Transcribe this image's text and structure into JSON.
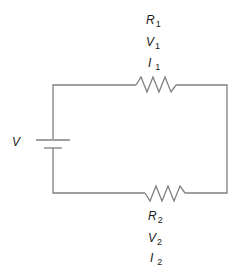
{
  "diagram": {
    "type": "series-circuit",
    "source": {
      "label": "V"
    },
    "components": [
      {
        "id": "R1",
        "symbol": "R",
        "sub": "1",
        "labels": [
          {
            "symbol": "R",
            "sub": "1"
          },
          {
            "symbol": "V",
            "sub": "1"
          },
          {
            "symbol": "I",
            "sub": "1"
          }
        ]
      },
      {
        "id": "R2",
        "symbol": "R",
        "sub": "2",
        "labels": [
          {
            "symbol": "R",
            "sub": "2"
          },
          {
            "symbol": "V",
            "sub": "2"
          },
          {
            "symbol": "I",
            "sub": "2"
          }
        ]
      }
    ],
    "colors": {
      "wire": "#808080",
      "text": "#1a1a1a"
    }
  }
}
